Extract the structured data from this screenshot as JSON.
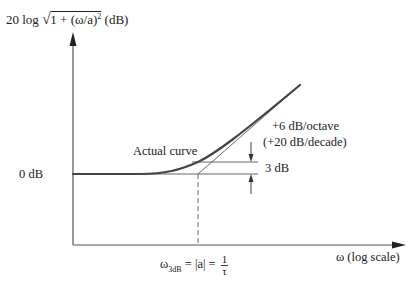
{
  "figure": {
    "y_axis_label": {
      "prefix": "20 log ",
      "radical": "√",
      "radicand": "1 + (ω/a)",
      "exponent": "2",
      "unit": " (dB)"
    },
    "x_axis_label": "ω (log scale)",
    "zero_db_label": "0 dB",
    "actual_curve_label": "Actual curve",
    "slope_label_line1": "+6 dB/octave",
    "slope_label_line2": "(+20 dB/decade)",
    "three_db_label": "3 dB",
    "corner_label": {
      "lhs": "ω",
      "lhs_sub": "3dB",
      "middle": " = |a| = ",
      "frac_num": "1",
      "frac_den": "τ"
    },
    "colors": {
      "axis": "#555555",
      "curve": "#444444",
      "text": "#222222",
      "background": "#ffffff"
    }
  }
}
